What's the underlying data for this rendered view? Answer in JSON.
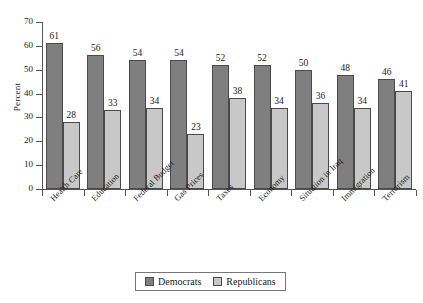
{
  "chart_data": {
    "type": "bar",
    "title": "",
    "subtitle": "",
    "xlabel": "",
    "ylabel": "Percent",
    "ylim": [
      0,
      70
    ],
    "yticks": [
      0,
      10,
      20,
      30,
      40,
      50,
      60,
      70
    ],
    "grid": false,
    "legend_position": "bottom",
    "categories": [
      "Health Care",
      "Education",
      "Federal Budget",
      "Gas Prices",
      "Taxes",
      "Economy",
      "Situation in Iraq",
      "Immigration",
      "Terrorism"
    ],
    "series": [
      {
        "name": "Democrats",
        "color": "#7f7f7f",
        "values": [
          61,
          56,
          54,
          54,
          52,
          52,
          50,
          48,
          46
        ]
      },
      {
        "name": "Republicans",
        "color": "#c8c8c8",
        "values": [
          28,
          33,
          34,
          23,
          38,
          34,
          36,
          34,
          41
        ]
      }
    ]
  },
  "legend": {
    "items": [
      {
        "label": "Democrats",
        "color": "#7f7f7f"
      },
      {
        "label": "Republicans",
        "color": "#c8c8c8"
      }
    ]
  }
}
